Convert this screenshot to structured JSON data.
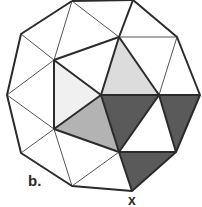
{
  "figure": {
    "panel_label": "b.",
    "vertex_label": "x",
    "colors": {
      "stroke": "#2b2b2b",
      "thin_stroke": "#555555",
      "light_fill": "#f0f0f0",
      "mid_light_fill": "#dcdcdc",
      "mid_fill": "#b3b3b3",
      "dark_fill": "#5a5a5a",
      "white_fill": "#ffffff"
    },
    "vertices": {
      "A": [
        72,
        1
      ],
      "B": [
        133,
        0
      ],
      "C": [
        21,
        34
      ],
      "D": [
        119,
        37
      ],
      "E": [
        177,
        37
      ],
      "F": [
        54,
        60
      ],
      "G": [
        7,
        95
      ],
      "H": [
        101,
        95
      ],
      "I": [
        159,
        95
      ],
      "J": [
        200,
        95
      ],
      "K": [
        54,
        129
      ],
      "L": [
        21,
        153
      ],
      "M": [
        119,
        152
      ],
      "N": [
        176,
        152
      ],
      "O": [
        72,
        186
      ],
      "P": [
        132,
        191
      ]
    },
    "shaded_faces": [
      {
        "name": "light-triangle-left",
        "points": "54,60 101,95 54,129",
        "fill": "light_fill"
      },
      {
        "name": "light-triangle-top",
        "points": "119,37 159,95 101,95",
        "fill": "mid_light_fill"
      },
      {
        "name": "medium-triangle",
        "points": "54,129 101,95 119,152",
        "fill": "mid_fill"
      },
      {
        "name": "dark-triangle-center",
        "points": "101,95 159,95 119,152",
        "fill": "dark_fill"
      },
      {
        "name": "dark-triangle-right",
        "points": "159,95 200,95 176,152",
        "fill": "dark_fill"
      },
      {
        "name": "dark-triangle-bottom",
        "points": "119,152 176,152 132,191",
        "fill": "dark_fill"
      }
    ]
  }
}
